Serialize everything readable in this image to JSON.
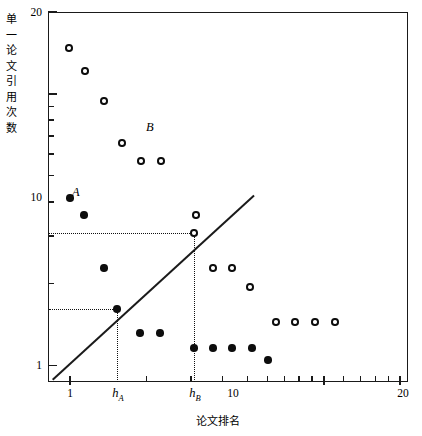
{
  "chart_data": {
    "type": "scatter",
    "title": "",
    "xlabel": "论文排名",
    "ylabel": "单一论文引用次数",
    "xscale": "log",
    "yscale": "log",
    "xlim": [
      1,
      20
    ],
    "ylim": [
      1,
      20
    ],
    "grid": false,
    "legend": "none",
    "x_tick_labels": [
      "1",
      "10",
      "20"
    ],
    "y_tick_labels": [
      "20",
      "10",
      "1"
    ],
    "annotations": [
      {
        "text": "A",
        "x": 1.35,
        "y": 10.8,
        "series": "A"
      },
      {
        "text": "B",
        "x": 4.3,
        "y": 14.2,
        "series": "B"
      }
    ],
    "reference_line": {
      "name": "identity-line",
      "equation": "y = x",
      "from": [
        1,
        1
      ],
      "to": [
        9.6,
        9.6
      ]
    },
    "h_indices": [
      {
        "label": "h",
        "subscript": "A",
        "series": "A",
        "x": 3.0,
        "y": 3.0,
        "marker": "filled"
      },
      {
        "label": "h",
        "subscript": "B",
        "series": "B",
        "x": 6.7,
        "y": 6.7,
        "marker": "open"
      }
    ],
    "series": [
      {
        "name": "A",
        "marker": "filled-circle",
        "color": "#0d0d0d",
        "x": [
          1,
          1.35,
          2.05,
          3.0,
          4.3,
          5.2,
          6.7,
          8.0,
          9.0,
          10.2,
          11.5
        ],
        "y": [
          10.0,
          8.6,
          5.2,
          3.0,
          2.05,
          2.05,
          1.55,
          1.55,
          1.55,
          1.55,
          1.3
        ]
      },
      {
        "name": "B",
        "marker": "open-circle",
        "color": "#0d0d0d",
        "x": [
          1.18,
          1.62,
          2.3,
          3.2,
          4.3,
          5.3,
          4.4,
          6.7,
          8.0,
          9.3,
          10.8,
          12.4,
          14.0,
          15.8,
          17.5,
          2.9
        ],
        "y": [
          18.0,
          16.5,
          14.0,
          12.6,
          11.9,
          11.9,
          11.9,
          6.6,
          5.2,
          5.2,
          4.3,
          4.3,
          3.6,
          2.9,
          2.9,
          14.0
        ]
      }
    ],
    "points_A": [
      {
        "px": 70,
        "py": 198
      },
      {
        "px": 84,
        "py": 215
      },
      {
        "px": 104,
        "py": 268
      },
      {
        "px": 117,
        "py": 309
      },
      {
        "px": 140,
        "py": 333
      },
      {
        "px": 160,
        "py": 333
      },
      {
        "px": 194,
        "py": 348
      },
      {
        "px": 213,
        "py": 348
      },
      {
        "px": 232,
        "py": 348
      },
      {
        "px": 252,
        "py": 348
      },
      {
        "px": 268,
        "py": 360
      }
    ],
    "points_B": [
      {
        "px": 69,
        "py": 48
      },
      {
        "px": 85,
        "py": 71
      },
      {
        "px": 104,
        "py": 101
      },
      {
        "px": 122,
        "py": 143
      },
      {
        "px": 141,
        "py": 161
      },
      {
        "px": 161,
        "py": 161
      },
      {
        "px": 194,
        "py": 233
      },
      {
        "px": 213,
        "py": 268
      },
      {
        "px": 232,
        "py": 268
      },
      {
        "px": 250,
        "py": 287
      },
      {
        "px": 276,
        "py": 322
      },
      {
        "px": 295,
        "py": 322
      },
      {
        "px": 315,
        "py": 322
      },
      {
        "px": 335,
        "py": 322
      },
      {
        "px": 196,
        "py": 215
      }
    ]
  },
  "axes": {
    "y_labels": [
      {
        "text": "20",
        "px": 42,
        "py": 6
      },
      {
        "text": "10",
        "px": 42,
        "py": 191
      },
      {
        "text": "1",
        "px": 42,
        "py": 359
      }
    ],
    "x_labels": [
      {
        "text": "1",
        "px": 70,
        "py": 387
      },
      {
        "text": "10",
        "px": 233,
        "py": 387
      },
      {
        "text": "20",
        "px": 403,
        "py": 387
      }
    ],
    "ylabel_chars": [
      "单",
      "一",
      "论",
      "文",
      "引",
      "用",
      "次",
      "数"
    ],
    "xlabel_text": "论文排名",
    "h_a_label": "h",
    "h_a_sub": "A",
    "h_b_label": "h",
    "h_b_sub": "B"
  },
  "colors": {
    "axis": "#1a1a1a",
    "marker": "#0d0d0d",
    "background": "#ffffff",
    "guide": "#111111"
  }
}
